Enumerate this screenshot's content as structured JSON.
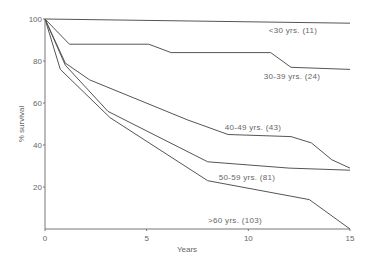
{
  "chart_data": {
    "type": "line",
    "title": "",
    "xlabel": "Years",
    "ylabel": "% survival",
    "xlim": [
      0,
      15
    ],
    "ylim": [
      0,
      100
    ],
    "x_ticks": [
      0,
      5,
      10,
      15
    ],
    "y_ticks": [
      20,
      40,
      60,
      80,
      100
    ],
    "grid": false,
    "legend": "inline labels",
    "series": [
      {
        "name": "<30 yrs. (11)",
        "points": [
          [
            0,
            100
          ],
          [
            15,
            98
          ]
        ]
      },
      {
        "name": "30-39 yrs. (24)",
        "points": [
          [
            0,
            100
          ],
          [
            1.2,
            88
          ],
          [
            5.1,
            88
          ],
          [
            6.2,
            84
          ],
          [
            11.1,
            84
          ],
          [
            12.1,
            77
          ],
          [
            15,
            76
          ]
        ]
      },
      {
        "name": "40-49 yrs. (43)",
        "points": [
          [
            0,
            100
          ],
          [
            1,
            79
          ],
          [
            2.2,
            71
          ],
          [
            7,
            52
          ],
          [
            9,
            45
          ],
          [
            12.1,
            44
          ],
          [
            13.1,
            41
          ],
          [
            14.1,
            33
          ],
          [
            15,
            29
          ]
        ]
      },
      {
        "name": "50-59 yrs. (81)",
        "points": [
          [
            0,
            100
          ],
          [
            1,
            78
          ],
          [
            3.1,
            56
          ],
          [
            8,
            32
          ],
          [
            12,
            29
          ],
          [
            15,
            28
          ]
        ]
      },
      {
        "name": ">60 yrs. (103)",
        "points": [
          [
            0,
            100
          ],
          [
            0.75,
            76
          ],
          [
            3.2,
            53
          ],
          [
            8,
            23
          ],
          [
            13,
            14
          ],
          [
            15,
            0
          ]
        ]
      }
    ]
  },
  "labels": {
    "xlabel": "Years",
    "ylabel": "% survival",
    "x_ticks": [
      "0",
      "5",
      "10",
      "15"
    ],
    "y_ticks": [
      "20",
      "40",
      "60",
      "80",
      "100"
    ],
    "series": [
      "<30 yrs. (11)",
      "30-39 yrs. (24)",
      "40-49 yrs. (43)",
      "50-59 yrs. (81)",
      ">60 yrs. (103)"
    ]
  }
}
